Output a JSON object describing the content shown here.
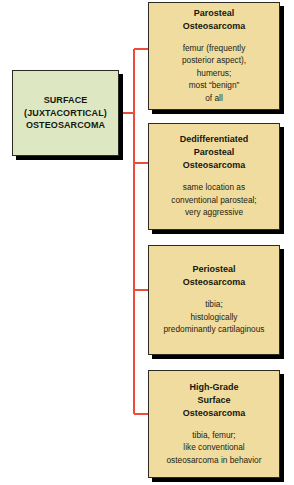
{
  "diagram": {
    "type": "tree",
    "orientation": "left-to-right",
    "colors": {
      "root_fill": "#dde8c3",
      "leaf_fill": "#f0dc9e",
      "border": "#2b2b23",
      "shadow": "#000000",
      "connector": "#ef4b3a",
      "text": "#17170f",
      "background": "#ffffff"
    },
    "root": {
      "id": "surface-juxtacortical-osteosarcoma",
      "title_lines": [
        "SURFACE",
        "(JUXTACORTICAL)",
        "OSTEOSARCOMA"
      ]
    },
    "leaves": [
      {
        "id": "parosteal-osteosarcoma",
        "title_lines": [
          "Parosteal",
          "Osteosarcoma"
        ],
        "desc_lines": [
          "femur (frequently",
          "posterior aspect),",
          "humerus;",
          "most “benign”",
          "of all"
        ]
      },
      {
        "id": "dedifferentiated-parosteal-osteosarcoma",
        "title_lines": [
          "Dedifferentiated",
          "Parosteal",
          "Osteosarcoma"
        ],
        "desc_lines": [
          "same location as",
          "conventional parosteal;",
          "very aggressive"
        ]
      },
      {
        "id": "periosteal-osteosarcoma",
        "title_lines": [
          "Periosteal",
          "Osteosarcoma"
        ],
        "desc_lines": [
          "tibia;",
          "histologically",
          "predominantly cartilaginous"
        ]
      },
      {
        "id": "high-grade-surface-osteosarcoma",
        "title_lines": [
          "High-Grade",
          "Surface",
          "Osteosarcoma"
        ],
        "desc_lines": [
          "tibia, femur;",
          "like conventional",
          "osteosarcoma in behavior"
        ]
      }
    ]
  }
}
